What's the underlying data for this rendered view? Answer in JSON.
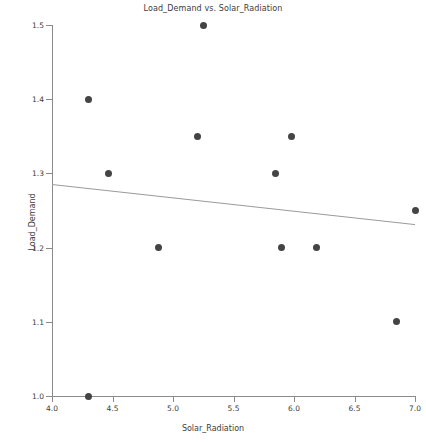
{
  "chart_data": {
    "type": "scatter",
    "title": "Load_Demand vs. Solar_Radiation",
    "xlabel": "Solar_Radiation",
    "ylabel": "Load_Demand",
    "xlim": [
      4.0,
      7.0
    ],
    "ylim": [
      1.0,
      1.5
    ],
    "grid": false,
    "legend": null,
    "xticks": [
      "4.0",
      "4.5",
      "5.0",
      "5.5",
      "6.0",
      "6.5",
      "7.0"
    ],
    "xtick_values": [
      4.0,
      4.5,
      5.0,
      5.5,
      6.0,
      6.5,
      7.0
    ],
    "yticks": [
      "1.0",
      "1.1",
      "1.2",
      "1.3",
      "1.4",
      "1.5"
    ],
    "ytick_values": [
      1.0,
      1.1,
      1.2,
      1.3,
      1.4,
      1.5
    ],
    "marker_color": "#444444",
    "line_color": "#9a9a9a",
    "points": [
      {
        "x": 4.3,
        "y": 1.4
      },
      {
        "x": 4.3,
        "y": 1.0
      },
      {
        "x": 4.47,
        "y": 1.3
      },
      {
        "x": 4.88,
        "y": 1.2
      },
      {
        "x": 5.2,
        "y": 1.35
      },
      {
        "x": 5.25,
        "y": 1.5
      },
      {
        "x": 5.85,
        "y": 1.3
      },
      {
        "x": 5.9,
        "y": 1.2
      },
      {
        "x": 5.98,
        "y": 1.35
      },
      {
        "x": 6.19,
        "y": 1.2
      },
      {
        "x": 6.85,
        "y": 1.1
      },
      {
        "x": 7.0,
        "y": 1.25
      }
    ],
    "trendline": {
      "x_start": 4.0,
      "y_start": 1.285,
      "x_end": 7.0,
      "y_end": 1.231
    }
  }
}
